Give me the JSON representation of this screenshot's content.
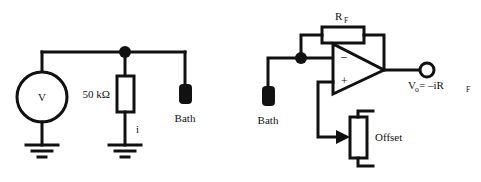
{
  "figure": {
    "background_color": "#ffffff",
    "ink_color": "#111111",
    "width": 481,
    "height": 182
  },
  "left_circuit": {
    "name": "passive-series-resistor-circuit",
    "source_label": "V",
    "resistor_label": "50 kΩ",
    "current_label": "i",
    "electrode_label": "Bath",
    "ground_count": 2
  },
  "right_circuit": {
    "name": "transimpedance-amplifier-circuit",
    "feedback_resistor_label": "R",
    "feedback_resistor_sub": "F",
    "electrode_label": "Bath",
    "opamp_inverting_label": "–",
    "opamp_noninverting_label": "+",
    "offset_label": "Offset",
    "output_label_v": "V",
    "output_label_v_sub": "o",
    "output_label_eq": " = –iR",
    "output_label_eq_sub": "F"
  }
}
